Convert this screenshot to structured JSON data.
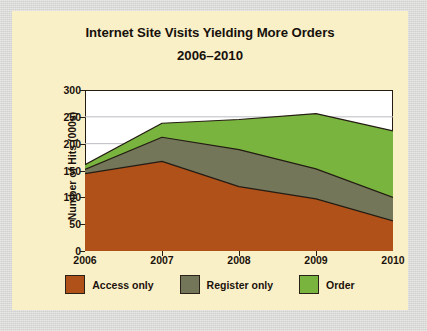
{
  "figure": {
    "background_color": "#faf0c8",
    "surround_color": "#d7d7d5"
  },
  "title": {
    "line1": "Internet Site Visits Yielding More Orders",
    "line2": "2006–2010"
  },
  "axes": {
    "y_title": "Number of Hits (000s)",
    "y_ticks": [
      "300",
      "250",
      "200",
      "150",
      "100",
      "50",
      "0"
    ],
    "x_ticks": [
      "2006",
      "2007",
      "2008",
      "2009",
      "2010"
    ]
  },
  "legend": {
    "items": [
      {
        "label": "Access only",
        "color": "#b0511a"
      },
      {
        "label": "Register only",
        "color": "#74765a"
      },
      {
        "label": "Order",
        "color": "#79b43f"
      }
    ]
  },
  "chart_data": {
    "type": "area",
    "stacked": true,
    "title": "Internet Site Visits Yielding More Orders 2006–2010",
    "xlabel": "",
    "ylabel": "Number of Hits (000s)",
    "categories": [
      "2006",
      "2007",
      "2008",
      "2009",
      "2010"
    ],
    "ylim": [
      0,
      300
    ],
    "ytick_step": 50,
    "grid": "horizontal",
    "legend_position": "bottom",
    "series": [
      {
        "name": "Access only",
        "color": "#b0511a",
        "values": [
          144,
          167,
          120,
          97,
          56
        ],
        "cumulative_top": [
          144,
          167,
          120,
          97,
          56
        ]
      },
      {
        "name": "Register only",
        "color": "#74765a",
        "values": [
          8,
          45,
          69,
          56,
          44
        ],
        "cumulative_top": [
          152,
          212,
          189,
          153,
          100
        ]
      },
      {
        "name": "Order",
        "color": "#79b43f",
        "values": [
          9,
          26,
          56,
          103,
          124
        ],
        "cumulative_top": [
          161,
          238,
          245,
          256,
          224
        ]
      }
    ],
    "totals": [
      161,
      238,
      245,
      256,
      224
    ]
  }
}
